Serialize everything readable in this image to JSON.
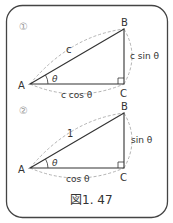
{
  "figure": {
    "caption": "図1. 47",
    "panel1": {
      "marker": "①",
      "vertex_a": "A",
      "vertex_b": "B",
      "vertex_c": "C",
      "angle": "θ",
      "hypotenuse": "c",
      "opposite": "c sin θ",
      "adjacent": "c cos θ"
    },
    "panel2": {
      "marker": "②",
      "vertex_a": "A",
      "vertex_b": "B",
      "vertex_c": "C",
      "angle": "θ",
      "hypotenuse": "1",
      "opposite": "sin θ",
      "adjacent": "cos θ"
    }
  },
  "colors": {
    "line": "#333333",
    "dashed": "#aaaaaa",
    "marker": "#999999",
    "border": "#444444"
  }
}
